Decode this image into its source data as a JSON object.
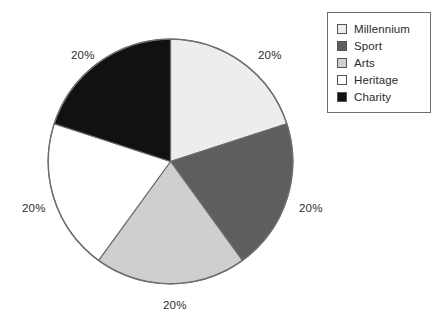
{
  "chart_data": {
    "type": "pie",
    "title": "",
    "subtitle": "",
    "xlabel": "",
    "ylabel": "",
    "grid": false,
    "legend_position": "top-right",
    "start_angle_deg": 0,
    "direction": "clockwise",
    "categories": [
      "Millennium",
      "Sport",
      "Arts",
      "Heritage",
      "Charity"
    ],
    "values": [
      20,
      20,
      20,
      20,
      20
    ],
    "value_unit": "%",
    "data_labels": [
      "20%",
      "20%",
      "20%",
      "20%",
      "20%"
    ],
    "slice_colors": [
      "#ededed",
      "#5e5e5e",
      "#cfcfcf",
      "#ffffff",
      "#111111"
    ],
    "slice_edge_color": "#6e6e6e",
    "slices": [
      {
        "label": "Millennium",
        "value": 20,
        "data_label": "20%",
        "color": "#ededed",
        "start_deg": 0,
        "end_deg": 72
      },
      {
        "label": "Sport",
        "value": 20,
        "data_label": "20%",
        "color": "#5e5e5e",
        "start_deg": 72,
        "end_deg": 144
      },
      {
        "label": "Arts",
        "value": 20,
        "data_label": "20%",
        "color": "#cfcfcf",
        "start_deg": 144,
        "end_deg": 216
      },
      {
        "label": "Heritage",
        "value": 20,
        "data_label": "20%",
        "color": "#ffffff",
        "start_deg": 216,
        "end_deg": 288
      },
      {
        "label": "Charity",
        "value": 20,
        "data_label": "20%",
        "color": "#111111",
        "start_deg": 288,
        "end_deg": 360
      }
    ]
  },
  "legend": {
    "items": [
      {
        "label": "Millennium",
        "color": "#ededed"
      },
      {
        "label": "Sport",
        "color": "#5e5e5e"
      },
      {
        "label": "Arts",
        "color": "#cfcfcf"
      },
      {
        "label": "Heritage",
        "color": "#ffffff"
      },
      {
        "label": "Charity",
        "color": "#111111"
      }
    ]
  },
  "colors": {
    "background": "#ffffff",
    "text": "#2b2b2b",
    "outline": "#6e6e6e"
  }
}
